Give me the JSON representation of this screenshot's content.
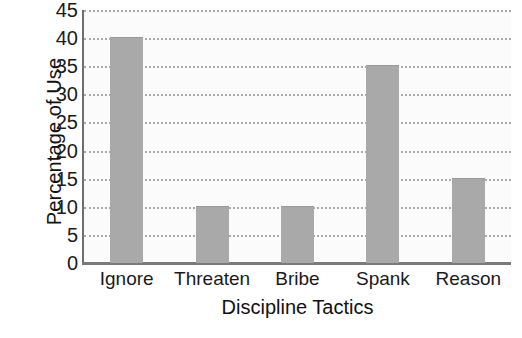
{
  "chart_data": {
    "type": "bar",
    "title": "",
    "subtitle": "",
    "xlabel": "Discipline Tactics",
    "ylabel": "Percentage of Use",
    "categories": [
      "Ignore",
      "Threaten",
      "Bribe",
      "Spank",
      "Reason"
    ],
    "values": [
      40,
      10,
      10,
      35,
      15
    ],
    "series": [
      {
        "name": "Percentage of Use",
        "values": [
          40,
          10,
          10,
          35,
          15
        ]
      }
    ],
    "ylim": [
      0,
      45
    ],
    "ytick_step": 5,
    "yticks": [
      45,
      40,
      35,
      30,
      25,
      20,
      15,
      10,
      5,
      0
    ],
    "ytick_labels": [
      "45",
      "40",
      "35",
      "30",
      "25",
      "20",
      "15",
      "10",
      "5",
      "0"
    ],
    "grid": true,
    "grid_axis": "y",
    "grid_style": "dotted",
    "legend": false,
    "legend_position": "none",
    "bar_color": "#a9a9a9",
    "grid_color": "#a9a9a9",
    "axis_color": "#6e6e6e",
    "plot_background": "#fbfbfb",
    "figure_background": "#ffffff",
    "text_color": "#1a1a1a"
  }
}
